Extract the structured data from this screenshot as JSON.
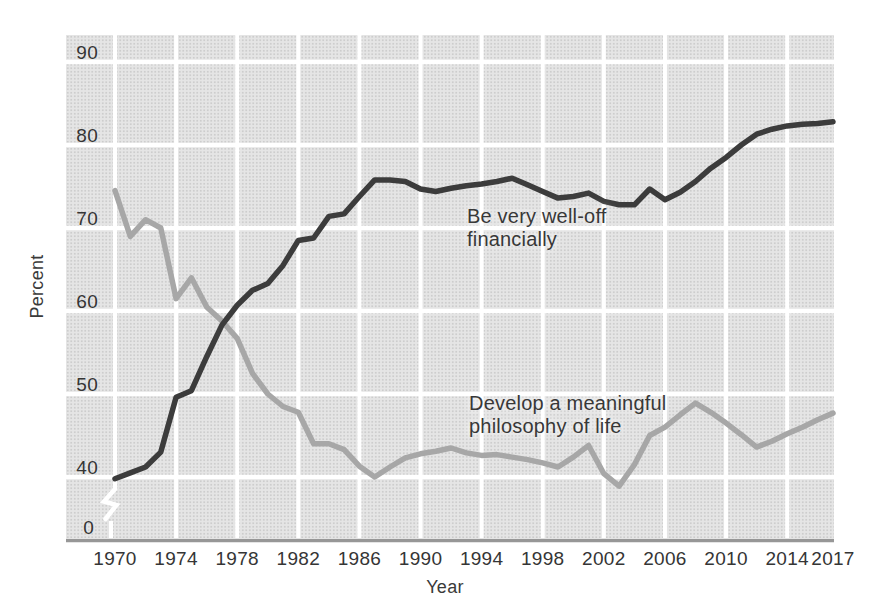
{
  "figure": {
    "y_axis_title": "Percent",
    "x_axis_title": "Year",
    "y_ticks": [
      90,
      80,
      70,
      60,
      50,
      40
    ],
    "y_zero_label": "0",
    "x_ticks": [
      1970,
      1974,
      1978,
      1982,
      1986,
      1990,
      1994,
      1998,
      2002,
      2006,
      2010,
      2014,
      2017
    ]
  },
  "annotations": {
    "well_off": {
      "line1": "Be very well-off",
      "line2": "financially"
    },
    "philosophy": {
      "line1": "Develop a meaningful",
      "line2": "philosophy of life"
    }
  },
  "colors": {
    "well_off_line": "#3c3c3c",
    "philosophy_line": "#a7a7a7",
    "plot_background": "#e5e5e5",
    "gridline": "#ffffff",
    "axis_line": "#979797",
    "text": "#383838"
  },
  "chart_data": {
    "type": "line",
    "title": "",
    "xlabel": "Year",
    "ylabel": "Percent",
    "ylim": [
      0,
      93
    ],
    "y_axis_break_between": [
      0,
      40
    ],
    "grid": true,
    "legend_position": "inline-annotations",
    "x": [
      1970,
      1971,
      1972,
      1973,
      1974,
      1975,
      1976,
      1977,
      1978,
      1979,
      1980,
      1981,
      1982,
      1983,
      1984,
      1985,
      1986,
      1987,
      1988,
      1989,
      1990,
      1991,
      1992,
      1993,
      1994,
      1995,
      1996,
      1997,
      1998,
      1999,
      2000,
      2001,
      2002,
      2003,
      2004,
      2005,
      2006,
      2007,
      2008,
      2009,
      2010,
      2011,
      2012,
      2013,
      2014,
      2015,
      2016,
      2017
    ],
    "series": [
      {
        "name": "Be very well-off financially",
        "color": "#3c3c3c",
        "values": [
          39.8,
          40.5,
          41.2,
          43,
          49.6,
          50.4,
          54.5,
          58.3,
          60.7,
          62.5,
          63.3,
          65.5,
          68.5,
          68.8,
          71.4,
          71.7,
          73.8,
          75.8,
          75.8,
          75.6,
          74.7,
          74.4,
          74.8,
          75.1,
          75.3,
          75.6,
          76,
          75.2,
          74.4,
          73.6,
          73.8,
          74.2,
          73.2,
          72.8,
          72.8,
          74.7,
          73.4,
          74.3,
          75.6,
          77.2,
          78.5,
          80,
          81.3,
          81.9,
          82.3,
          82.5,
          82.6,
          82.8
        ]
      },
      {
        "name": "Develop a meaningful philosophy of life",
        "color": "#a7a7a7",
        "values": [
          74.5,
          69,
          71,
          70,
          61.5,
          64,
          60.5,
          58.8,
          56.7,
          52.5,
          50,
          48.5,
          47.8,
          44,
          44,
          43.3,
          41.3,
          40,
          41.2,
          42.3,
          42.8,
          43.1,
          43.5,
          42.9,
          42.6,
          42.7,
          42.4,
          42.1,
          41.7,
          41.2,
          42.4,
          43.8,
          40.4,
          38.9,
          41.5,
          45,
          46,
          47.5,
          48.9,
          47.8,
          46.5,
          45.1,
          43.6,
          44.3,
          45.2,
          46,
          46.9,
          47.7
        ]
      }
    ]
  }
}
